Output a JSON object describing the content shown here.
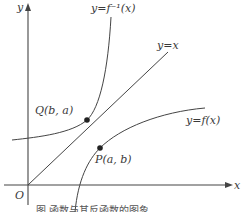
{
  "figure": {
    "axes": {
      "x_label": "x",
      "y_label": "y",
      "origin_label": "O"
    },
    "curves": {
      "inverse_label": "y=f⁻¹(x)",
      "identity_label": "y=x",
      "function_label": "y=f(x)"
    },
    "points": {
      "q_label": "Q(b, a)",
      "p_label": "P(a, b)"
    },
    "caption": "图   函数与其反函数的图象",
    "colors": {
      "stroke": "#444444",
      "point": "#222222"
    }
  }
}
